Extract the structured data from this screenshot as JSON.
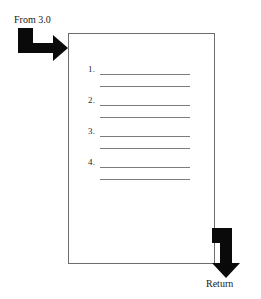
{
  "diagram": {
    "type": "page-flow-diagram",
    "background_color": "#ffffff",
    "ink_color": "#0a0a0a",
    "page": {
      "name": "document-page",
      "border_color": "#6d6d6d",
      "fill_color": "#ffffff",
      "list": {
        "items": [
          {
            "number": "1.",
            "line1": "",
            "line2": ""
          },
          {
            "number": "2.",
            "line1": "",
            "line2": ""
          },
          {
            "number": "3.",
            "line1": "",
            "line2": ""
          },
          {
            "number": "4.",
            "line1": "",
            "line2": ""
          }
        ],
        "rule_color": "#7c7c7c"
      }
    },
    "connectors": {
      "incoming": {
        "label": "From 3.0",
        "icon": "elbow-arrow-down-right-icon",
        "direction": "right",
        "color": "#0a0a0a"
      },
      "outgoing": {
        "label": "Return",
        "icon": "elbow-arrow-right-down-icon",
        "direction": "down",
        "color": "#0a0a0a"
      }
    }
  }
}
